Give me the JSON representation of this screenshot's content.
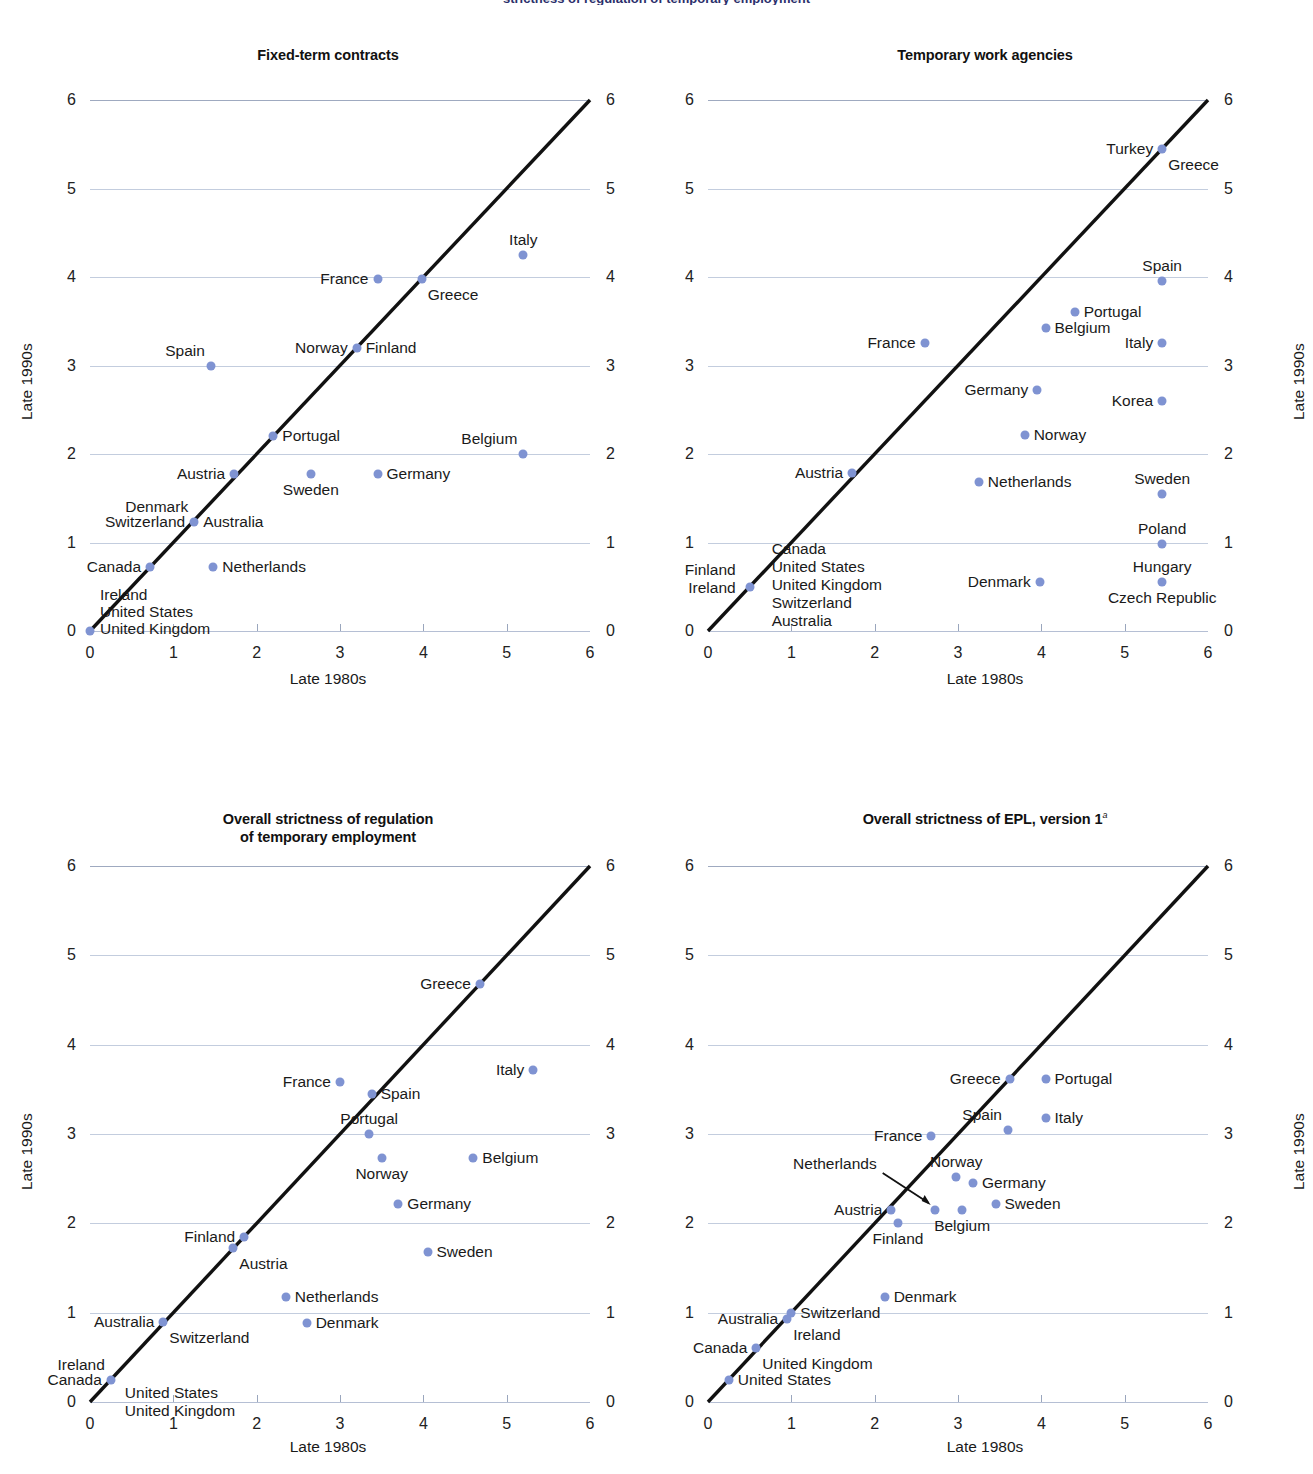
{
  "page": {
    "cropped_header": "strictness of regulation of temporary employment",
    "axis_x_label": "Late 1980s",
    "axis_y_label": "Late 1990s",
    "dot_color": "#7f93d2",
    "gridline_color": "#b9c4d8",
    "diagonal_color": "#111111",
    "axis_ticks": [
      0,
      1,
      2,
      3,
      4,
      5,
      6
    ]
  },
  "chart_data": [
    {
      "type": "scatter",
      "title": "Fixed-term contracts",
      "xlabel": "Late 1980s",
      "ylabel": "Late 1990s",
      "xlim": [
        0,
        6
      ],
      "ylim": [
        0,
        6
      ],
      "grid": true,
      "annotations": [
        "45-degree diagonal reference line from (0,0) to (6,6)"
      ],
      "points": [
        {
          "name": "Italy",
          "x": 5.2,
          "y": 4.25,
          "label_pos": "above"
        },
        {
          "name": "France",
          "x": 3.45,
          "y": 3.98,
          "label_pos": "left"
        },
        {
          "name": "Greece",
          "x": 3.98,
          "y": 3.98,
          "label_pos": "below-right"
        },
        {
          "name": "Spain",
          "x": 1.45,
          "y": 3.0,
          "label_pos": "above-left"
        },
        {
          "name": "Norway",
          "x": 3.2,
          "y": 3.2,
          "label_pos": "left"
        },
        {
          "name": "Finland",
          "x": 3.2,
          "y": 3.2,
          "label_pos": "right"
        },
        {
          "name": "Portugal",
          "x": 2.2,
          "y": 2.2,
          "label_pos": "right"
        },
        {
          "name": "Belgium",
          "x": 5.2,
          "y": 2.0,
          "label_pos": "above-left"
        },
        {
          "name": "Austria",
          "x": 1.73,
          "y": 1.77,
          "label_pos": "left"
        },
        {
          "name": "Sweden",
          "x": 2.65,
          "y": 1.77,
          "label_pos": "below"
        },
        {
          "name": "Germany",
          "x": 3.45,
          "y": 1.77,
          "label_pos": "right"
        },
        {
          "name": "Denmark",
          "x": 1.25,
          "y": 1.23,
          "label_pos": "above-left"
        },
        {
          "name": "Switzerland",
          "x": 1.25,
          "y": 1.23,
          "label_pos": "left"
        },
        {
          "name": "Australia",
          "x": 1.25,
          "y": 1.23,
          "label_pos": "right"
        },
        {
          "name": "Canada",
          "x": 0.72,
          "y": 0.72,
          "label_pos": "left"
        },
        {
          "name": "Netherlands",
          "x": 1.48,
          "y": 0.72,
          "label_pos": "right"
        },
        {
          "name": "Ireland",
          "x": 0.0,
          "y": 0.0,
          "label_pos": "stack-1"
        },
        {
          "name": "United States",
          "x": 0.0,
          "y": 0.0,
          "label_pos": "stack-2"
        },
        {
          "name": "United Kingdom",
          "x": 0.0,
          "y": 0.0,
          "label_pos": "stack-3"
        }
      ]
    },
    {
      "type": "scatter",
      "title": "Temporary work agencies",
      "xlabel": "Late 1980s",
      "ylabel": "Late 1990s",
      "xlim": [
        0,
        6
      ],
      "ylim": [
        0,
        6
      ],
      "grid": true,
      "annotations": [
        "45-degree diagonal reference line from (0,0) to (6,6)"
      ],
      "points": [
        {
          "name": "Turkey",
          "x": 5.45,
          "y": 5.45,
          "label_pos": "left"
        },
        {
          "name": "Greece",
          "x": 5.45,
          "y": 5.45,
          "label_pos": "below-right"
        },
        {
          "name": "Spain",
          "x": 5.45,
          "y": 3.95,
          "label_pos": "above"
        },
        {
          "name": "Portugal",
          "x": 4.4,
          "y": 3.6,
          "label_pos": "right"
        },
        {
          "name": "Belgium",
          "x": 4.05,
          "y": 3.42,
          "label_pos": "right"
        },
        {
          "name": "France",
          "x": 2.6,
          "y": 3.25,
          "label_pos": "left"
        },
        {
          "name": "Italy",
          "x": 5.45,
          "y": 3.25,
          "label_pos": "left"
        },
        {
          "name": "Germany",
          "x": 3.95,
          "y": 2.72,
          "label_pos": "left"
        },
        {
          "name": "Korea",
          "x": 5.45,
          "y": 2.6,
          "label_pos": "left"
        },
        {
          "name": "Norway",
          "x": 3.8,
          "y": 2.22,
          "label_pos": "right"
        },
        {
          "name": "Austria",
          "x": 1.73,
          "y": 1.78,
          "label_pos": "left"
        },
        {
          "name": "Netherlands",
          "x": 3.25,
          "y": 1.68,
          "label_pos": "right"
        },
        {
          "name": "Sweden",
          "x": 5.45,
          "y": 1.55,
          "label_pos": "above"
        },
        {
          "name": "Poland",
          "x": 5.45,
          "y": 0.98,
          "label_pos": "above"
        },
        {
          "name": "Hungary",
          "x": 5.45,
          "y": 0.55,
          "label_pos": "above"
        },
        {
          "name": "Czech Republic",
          "x": 5.45,
          "y": 0.55,
          "label_pos": "below"
        },
        {
          "name": "Denmark",
          "x": 3.98,
          "y": 0.55,
          "label_pos": "left"
        },
        {
          "name": "Finland",
          "x": 0.5,
          "y": 0.5,
          "label_pos": "stack-left-1"
        },
        {
          "name": "Ireland",
          "x": 0.5,
          "y": 0.5,
          "label_pos": "stack-left-2"
        },
        {
          "name": "Canada",
          "x": 0.5,
          "y": 0.5,
          "label_pos": "stack-right-1"
        },
        {
          "name": "United States",
          "x": 0.5,
          "y": 0.5,
          "label_pos": "stack-right-2"
        },
        {
          "name": "United Kingdom",
          "x": 0.5,
          "y": 0.5,
          "label_pos": "stack-right-3"
        },
        {
          "name": "Switzerland",
          "x": 0.5,
          "y": 0.5,
          "label_pos": "stack-right-4"
        },
        {
          "name": "Australia",
          "x": 0.5,
          "y": 0.5,
          "label_pos": "stack-right-5"
        }
      ]
    },
    {
      "type": "scatter",
      "title_line1": "Overall strictness of regulation",
      "title_line2": "of temporary employment",
      "title": "Overall strictness of regulation of temporary employment",
      "xlabel": "Late 1980s",
      "ylabel": "Late 1990s",
      "xlim": [
        0,
        6
      ],
      "ylim": [
        0,
        6
      ],
      "grid": true,
      "annotations": [
        "45-degree diagonal reference line from (0,0) to (6,6)"
      ],
      "points": [
        {
          "name": "Greece",
          "x": 4.68,
          "y": 4.68,
          "label_pos": "left"
        },
        {
          "name": "Italy",
          "x": 5.32,
          "y": 3.72,
          "label_pos": "left"
        },
        {
          "name": "France",
          "x": 3.0,
          "y": 3.58,
          "label_pos": "left"
        },
        {
          "name": "Spain",
          "x": 3.38,
          "y": 3.45,
          "label_pos": "right"
        },
        {
          "name": "Portugal",
          "x": 3.35,
          "y": 3.0,
          "label_pos": "above"
        },
        {
          "name": "Belgium",
          "x": 4.6,
          "y": 2.73,
          "label_pos": "right"
        },
        {
          "name": "Norway",
          "x": 3.5,
          "y": 2.73,
          "label_pos": "below"
        },
        {
          "name": "Germany",
          "x": 3.7,
          "y": 2.22,
          "label_pos": "right"
        },
        {
          "name": "Finland",
          "x": 1.85,
          "y": 1.85,
          "label_pos": "left"
        },
        {
          "name": "Austria",
          "x": 1.72,
          "y": 1.72,
          "label_pos": "below-right"
        },
        {
          "name": "Sweden",
          "x": 4.05,
          "y": 1.68,
          "label_pos": "right"
        },
        {
          "name": "Netherlands",
          "x": 2.35,
          "y": 1.18,
          "label_pos": "right"
        },
        {
          "name": "Australia",
          "x": 0.88,
          "y": 0.9,
          "label_pos": "left"
        },
        {
          "name": "Switzerland",
          "x": 0.88,
          "y": 0.9,
          "label_pos": "below-right"
        },
        {
          "name": "Denmark",
          "x": 2.6,
          "y": 0.88,
          "label_pos": "right"
        },
        {
          "name": "Ireland",
          "x": 0.25,
          "y": 0.25,
          "label_pos": "above-left"
        },
        {
          "name": "Canada",
          "x": 0.25,
          "y": 0.25,
          "label_pos": "left"
        },
        {
          "name": "United States",
          "x": 0.25,
          "y": 0.25,
          "label_pos": "right-1"
        },
        {
          "name": "United Kingdom",
          "x": 0.25,
          "y": 0.25,
          "label_pos": "right-2"
        }
      ]
    },
    {
      "type": "scatter",
      "title": "Overall strictness of EPL, version 1",
      "title_superscript": "a",
      "xlabel": "Late 1980s",
      "ylabel": "Late 1990s",
      "xlim": [
        0,
        6
      ],
      "ylim": [
        0,
        6
      ],
      "grid": true,
      "annotations": [
        "45-degree diagonal reference line from (0,0) to (6,6)",
        "Leader arrow from Netherlands label to its data point"
      ],
      "points": [
        {
          "name": "Portugal",
          "x": 4.05,
          "y": 3.62,
          "label_pos": "right"
        },
        {
          "name": "Greece",
          "x": 3.62,
          "y": 3.62,
          "label_pos": "left"
        },
        {
          "name": "Italy",
          "x": 4.05,
          "y": 3.18,
          "label_pos": "right"
        },
        {
          "name": "Spain",
          "x": 3.6,
          "y": 3.05,
          "label_pos": "above-left"
        },
        {
          "name": "France",
          "x": 2.68,
          "y": 2.98,
          "label_pos": "left"
        },
        {
          "name": "Norway",
          "x": 2.98,
          "y": 2.52,
          "label_pos": "above"
        },
        {
          "name": "Germany",
          "x": 3.18,
          "y": 2.45,
          "label_pos": "right"
        },
        {
          "name": "Sweden",
          "x": 3.45,
          "y": 2.22,
          "label_pos": "right"
        },
        {
          "name": "Austria",
          "x": 2.2,
          "y": 2.15,
          "label_pos": "left"
        },
        {
          "name": "Netherlands",
          "x": 2.72,
          "y": 2.15,
          "label_pos": "arrow-upper-left"
        },
        {
          "name": "Belgium",
          "x": 3.05,
          "y": 2.15,
          "label_pos": "below"
        },
        {
          "name": "Finland",
          "x": 2.28,
          "y": 2.0,
          "label_pos": "below"
        },
        {
          "name": "Denmark",
          "x": 2.12,
          "y": 1.18,
          "label_pos": "right"
        },
        {
          "name": "Switzerland",
          "x": 1.0,
          "y": 1.0,
          "label_pos": "right"
        },
        {
          "name": "Australia",
          "x": 0.95,
          "y": 0.93,
          "label_pos": "left"
        },
        {
          "name": "Ireland",
          "x": 0.95,
          "y": 0.93,
          "label_pos": "below-right"
        },
        {
          "name": "Canada",
          "x": 0.58,
          "y": 0.6,
          "label_pos": "left"
        },
        {
          "name": "United Kingdom",
          "x": 0.58,
          "y": 0.6,
          "label_pos": "below-right"
        },
        {
          "name": "United States",
          "x": 0.25,
          "y": 0.25,
          "label_pos": "right"
        }
      ]
    }
  ],
  "panels": [
    {
      "id": "fixed-term-contracts",
      "title": "Fixed-term contracts"
    },
    {
      "id": "temporary-work-agencies",
      "title": "Temporary work agencies"
    },
    {
      "id": "overall-strictness-temp-employment",
      "title_line1": "Overall strictness of regulation",
      "title_line2": "of temporary employment"
    },
    {
      "id": "overall-strictness-epl-v1",
      "title": "Overall strictness of EPL, version 1",
      "superscript": "a"
    }
  ]
}
